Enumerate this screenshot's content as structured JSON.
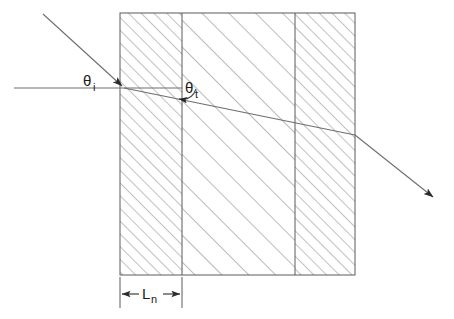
{
  "figure": {
    "background_color": "#ffffff",
    "line_color": "#5a5a5a",
    "ray_color": "#6e6e6e",
    "text_color": "#1a1a1a",
    "hatch_color": "#8c8c8c"
  },
  "labels": {
    "theta_incident": "θ",
    "theta_incident_sub": "i",
    "theta_transmitted": "θ",
    "theta_transmitted_sub": "t",
    "length_symbol": "L",
    "length_sub": "n"
  },
  "geometry": {
    "slab": {
      "left": 120,
      "right": 355,
      "top": 13,
      "bottom": 275,
      "divider_1_x": 182,
      "divider_2_x": 295
    },
    "regions": [
      {
        "name": "layer-left",
        "x": 120,
        "width": 62,
        "hatch": "dense"
      },
      {
        "name": "layer-middle",
        "x": 182,
        "width": 113,
        "hatch": "sparse"
      },
      {
        "name": "layer-right",
        "x": 295,
        "width": 60,
        "hatch": "dense"
      }
    ],
    "normal_line": {
      "x1": 14,
      "y1": 88,
      "x2": 182,
      "y2": 88
    },
    "incident_ray": {
      "x1": 43,
      "y1": 14,
      "x2": 124,
      "y2": 88
    },
    "refracted_ray": {
      "x1": 124,
      "y1": 88,
      "x2": 355,
      "y2": 135
    },
    "exit_ray": {
      "x1": 355,
      "y1": 135,
      "x2": 436,
      "y2": 200
    },
    "dimension": {
      "from_x": 120,
      "to_x": 182,
      "y": 294,
      "extension_top": 277,
      "extension_bottom": 308
    }
  }
}
